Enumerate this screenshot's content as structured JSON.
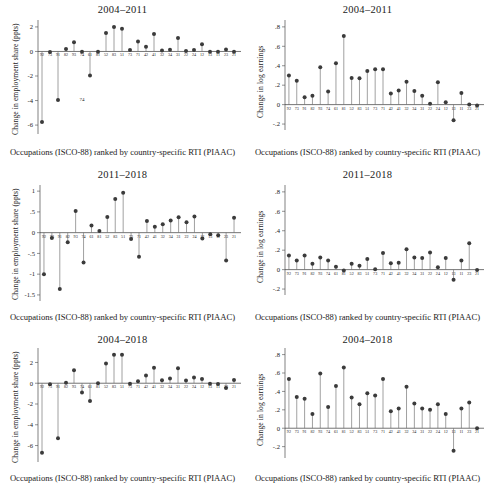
{
  "figure": {
    "xcaption": "Occupations (ISCO-88) ranked by country-specific RTI (PIAAC)",
    "ylabel_employment": "Change in employment share (ppts)",
    "ylabel_earnings": "Change in log earnings",
    "accent_dot": "#3b3b3b",
    "accent_stem": "#6e6e6e",
    "axis_color": "#4a4a4a"
  },
  "occupations": [
    "92",
    "73",
    "91",
    "82",
    "93",
    "74",
    "61",
    "81",
    "52",
    "83",
    "51",
    "73",
    "71",
    "42",
    "41",
    "32",
    "34",
    "31",
    "22",
    "24",
    "12",
    "13",
    "11",
    "23",
    "21"
  ],
  "chart_data": [
    {
      "id": "emp-2004-2011",
      "type": "scatter",
      "title": "2004–2011",
      "xlabel": "Occupations (ISCO-88) ranked by country-specific RTI (PIAAC)",
      "ylabel": "Change in employment share (ppts)",
      "ylim": [
        -6.4,
        2.4
      ],
      "yticks": [
        2,
        0,
        -2,
        -4,
        -6
      ],
      "yticklabels": [
        "2",
        "0",
        "-2",
        "-4",
        "-6"
      ],
      "grid": false,
      "legend": "none",
      "categories": [
        "92",
        "73",
        "91",
        "82",
        "93",
        "74",
        "61",
        "81",
        "52",
        "83",
        "51",
        "73",
        "71",
        "42",
        "41",
        "32",
        "34",
        "31",
        "22",
        "24",
        "12",
        "13",
        "11",
        "23",
        "21"
      ],
      "values": [
        -5.75,
        -0.05,
        -3.95,
        0.2,
        0.75,
        -0.02,
        -1.95,
        -0.02,
        1.5,
        2.0,
        1.85,
        0.12,
        0.82,
        0.38,
        1.42,
        0.08,
        0.14,
        1.1,
        0.03,
        0.12,
        0.58,
        -0.03,
        -0.02,
        0.15,
        -0.03
      ],
      "annotations": [
        {
          "text": "74",
          "x_index": 5,
          "y": -4.05
        }
      ]
    },
    {
      "id": "earn-2004-2011",
      "type": "scatter",
      "title": "2004–2011",
      "xlabel": "Occupations (ISCO-88) ranked by country-specific RTI (PIAAC)",
      "ylabel": "Change in log earnings",
      "ylim": [
        -0.22,
        0.85
      ],
      "yticks": [
        0.8,
        0.6,
        0.4,
        0.2,
        0,
        -0.2
      ],
      "yticklabels": [
        ".8",
        ".6",
        ".4",
        ".2",
        "0",
        "-.2"
      ],
      "grid": false,
      "legend": "none",
      "categories": [
        "92",
        "73",
        "91",
        "82",
        "93",
        "74",
        "61",
        "81",
        "52",
        "83",
        "51",
        "73",
        "71",
        "42",
        "41",
        "32",
        "34",
        "31",
        "22",
        "24",
        "12",
        "13",
        "11",
        "23",
        "21"
      ],
      "values": [
        0.3,
        0.245,
        0.075,
        0.09,
        0.385,
        0.135,
        0.425,
        0.705,
        0.275,
        0.27,
        0.345,
        0.365,
        0.365,
        0.115,
        0.145,
        0.235,
        0.14,
        0.09,
        0.01,
        0.23,
        0.025,
        -0.16,
        0.12,
        0.0,
        -0.01
      ],
      "annotations": []
    },
    {
      "id": "emp-2011-2018",
      "type": "scatter",
      "title": "2011–2018",
      "xlabel": "Occupations (ISCO-88) ranked by country-specific RTI (PIAAC)",
      "ylabel": "Change in employment share (ppts)",
      "ylim": [
        -1.55,
        1.1
      ],
      "yticks": [
        1,
        0.5,
        0,
        -0.5,
        -1,
        -1.5
      ],
      "yticklabels": [
        "1",
        ".5",
        "0",
        "-.5",
        "-1",
        "-1.5"
      ],
      "grid": false,
      "legend": "none",
      "categories": [
        "92",
        "73",
        "91",
        "82",
        "93",
        "74",
        "61",
        "81",
        "52",
        "83",
        "51",
        "73",
        "71",
        "42",
        "41",
        "32",
        "34",
        "31",
        "22",
        "24",
        "12",
        "13",
        "11",
        "23",
        "21"
      ],
      "values": [
        -1.0,
        -0.13,
        -1.36,
        -0.23,
        0.52,
        -0.72,
        0.17,
        0.04,
        0.38,
        0.81,
        0.96,
        -0.15,
        -0.58,
        0.28,
        0.14,
        0.2,
        0.29,
        0.37,
        0.25,
        0.39,
        -0.14,
        -0.04,
        -0.06,
        -0.67,
        0.36
      ],
      "annotations": []
    },
    {
      "id": "earn-2011-2018",
      "type": "scatter",
      "title": "2011–2018",
      "xlabel": "Occupations (ISCO-88) ranked by country-specific RTI (PIAAC)",
      "ylabel": "Change in log earnings",
      "ylim": [
        -0.22,
        0.85
      ],
      "yticks": [
        0.8,
        0.6,
        0.4,
        0.2,
        0,
        -0.2
      ],
      "yticklabels": [
        ".8",
        ".6",
        ".4",
        ".2",
        "0",
        "-.2"
      ],
      "grid": false,
      "legend": "none",
      "categories": [
        "92",
        "73",
        "91",
        "82",
        "93",
        "74",
        "61",
        "81",
        "52",
        "83",
        "51",
        "73",
        "71",
        "42",
        "41",
        "32",
        "34",
        "31",
        "22",
        "24",
        "12",
        "13",
        "11",
        "23",
        "21"
      ],
      "values": [
        0.145,
        0.095,
        0.145,
        0.06,
        0.125,
        0.095,
        0.03,
        -0.01,
        0.06,
        0.04,
        0.11,
        0.005,
        0.17,
        0.065,
        0.07,
        0.21,
        0.125,
        0.12,
        0.175,
        0.025,
        0.12,
        -0.105,
        0.095,
        0.27,
        -0.005
      ],
      "annotations": []
    },
    {
      "id": "emp-2004-2018",
      "type": "scatter",
      "title": "2004–2018",
      "xlabel": "Occupations (ISCO-88) ranked by country-specific RTI (PIAAC)",
      "ylabel": "Change in employment share (ppts)",
      "ylim": [
        -7.2,
        3.2
      ],
      "yticks": [
        2,
        0,
        -2,
        -4,
        -6
      ],
      "yticklabels": [
        "2",
        "0",
        "-2",
        "-4",
        "-6"
      ],
      "grid": false,
      "legend": "none",
      "categories": [
        "92",
        "73",
        "91",
        "82",
        "93",
        "74",
        "61",
        "81",
        "52",
        "83",
        "51",
        "73",
        "71",
        "42",
        "41",
        "32",
        "34",
        "31",
        "22",
        "24",
        "12",
        "13",
        "11",
        "23",
        "21"
      ],
      "values": [
        -6.7,
        -0.1,
        -5.3,
        0.05,
        1.25,
        -0.9,
        -1.7,
        0.0,
        1.9,
        2.75,
        2.75,
        -0.05,
        0.2,
        0.75,
        1.5,
        0.28,
        0.45,
        1.45,
        0.27,
        0.55,
        0.4,
        -0.05,
        -0.07,
        -0.45,
        0.3
      ],
      "annotations": []
    },
    {
      "id": "earn-2004-2018",
      "type": "scatter",
      "title": "2004–2018",
      "xlabel": "Occupations (ISCO-88) ranked by country-specific RTI (PIAAC)",
      "ylabel": "Change in log earnings",
      "ylim": [
        -0.28,
        0.85
      ],
      "yticks": [
        0.8,
        0.6,
        0.4,
        0.2,
        0,
        -0.2
      ],
      "yticklabels": [
        ".8",
        ".6",
        ".4",
        ".2",
        "0",
        "-.2"
      ],
      "grid": false,
      "legend": "none",
      "categories": [
        "92",
        "73",
        "91",
        "82",
        "93",
        "74",
        "61",
        "81",
        "52",
        "83",
        "51",
        "73",
        "71",
        "42",
        "41",
        "32",
        "34",
        "31",
        "22",
        "24",
        "12",
        "13",
        "11",
        "23",
        "21"
      ],
      "values": [
        0.535,
        0.34,
        0.32,
        0.155,
        0.595,
        0.23,
        0.46,
        0.66,
        0.335,
        0.26,
        0.38,
        0.355,
        0.535,
        0.185,
        0.215,
        0.45,
        0.27,
        0.215,
        0.2,
        0.26,
        0.155,
        -0.245,
        0.215,
        0.28,
        0.0
      ],
      "annotations": []
    }
  ]
}
